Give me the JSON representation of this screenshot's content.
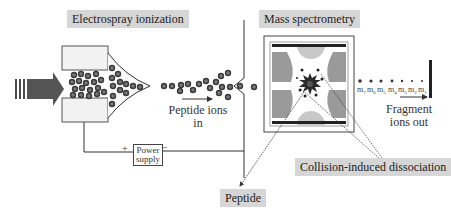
{
  "sections": {
    "esi": {
      "label": "Electrospray ionization"
    },
    "ms": {
      "label": "Mass spectrometry"
    }
  },
  "captions": {
    "peptide_ions_in": {
      "line1": "Peptide ions",
      "line2": "in"
    },
    "fragment_ions_out": {
      "line1": "Fragment",
      "line2": "ions out"
    }
  },
  "power_supply": {
    "line1": "Power",
    "line2": "supply",
    "plus": "+",
    "minus": "−"
  },
  "callouts": {
    "cid": "Collision-induced dissociation",
    "peptide": "Peptide"
  },
  "fragment_masses": [
    "m7",
    "m6",
    "m5",
    "m4",
    "m3",
    "m2",
    "m1"
  ],
  "colors": {
    "label_bg": "#d6d6d6",
    "ion": "#3a3a3a",
    "arrow": "#4a4a4a",
    "electrode": "#9a9a9a",
    "electrode_light": "#c8c8c8",
    "line": "#333333"
  }
}
